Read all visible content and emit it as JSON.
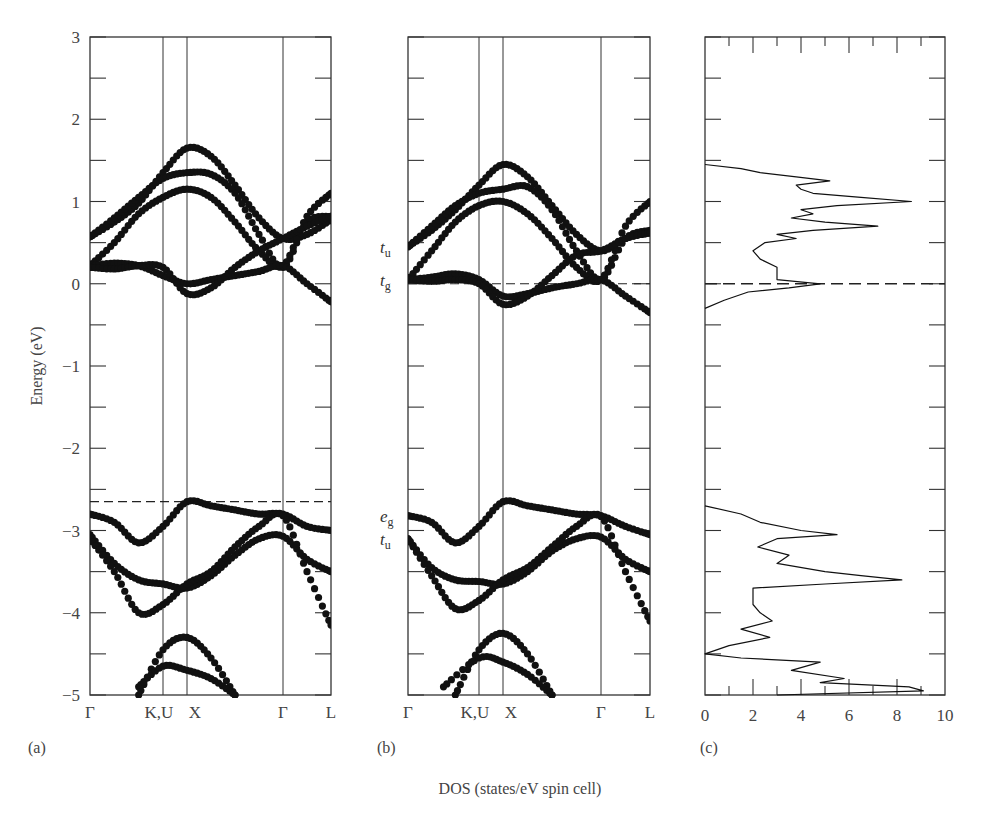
{
  "figure": {
    "y_axis_label": "Energy (eV)",
    "x_axis_label_c": "DOS (states/eV spin cell)",
    "panels": [
      {
        "id": "a",
        "label": "(a)"
      },
      {
        "id": "b",
        "label": "(b)"
      },
      {
        "id": "c",
        "label": "(c)"
      }
    ],
    "y_ticks": [
      "3",
      "2",
      "1",
      "0",
      "−1",
      "−2",
      "−3",
      "−4",
      "−5"
    ],
    "k_points": [
      "Γ",
      "K,U",
      "X",
      "Γ",
      "L"
    ],
    "dos_ticks": [
      "0",
      "2",
      "4",
      "6",
      "8",
      "10"
    ],
    "band_labels_b": [
      {
        "text": "t",
        "sub": "u",
        "energy": 0.45
      },
      {
        "text": "t",
        "sub": "g",
        "energy": 0.05
      },
      {
        "text": "e",
        "sub": "g",
        "energy": -2.82
      },
      {
        "text": "t",
        "sub": "u",
        "energy": -3.1
      }
    ],
    "colors": {
      "ink": "#111111",
      "axis": "#333333",
      "background": "#ffffff"
    }
  },
  "chart_data": [
    {
      "type": "scatter",
      "title": "(a) Band structure",
      "xlabel": "",
      "ylabel": "Energy (eV)",
      "ylim": [
        -5,
        3
      ],
      "x_ticks": [
        "Γ",
        "K,U",
        "X",
        "Γ",
        "L"
      ],
      "x_positions": [
        0,
        0.3,
        0.4,
        0.8,
        1.0
      ],
      "dashed_line_energy": -2.65,
      "grid": false,
      "series": [
        {
          "name": "band 1 (conduction)",
          "x": [
            0,
            0.1,
            0.2,
            0.3,
            0.4,
            0.5,
            0.6,
            0.7,
            0.8,
            0.9,
            1.0
          ],
          "y": [
            0.57,
            0.75,
            0.98,
            1.35,
            1.65,
            1.55,
            1.2,
            0.8,
            0.55,
            0.6,
            0.78
          ]
        },
        {
          "name": "band 2",
          "x": [
            0,
            0.1,
            0.2,
            0.3,
            0.4,
            0.5,
            0.6,
            0.7,
            0.8,
            0.9,
            1.0
          ],
          "y": [
            0.57,
            0.8,
            1.05,
            1.28,
            1.35,
            1.33,
            1.1,
            0.6,
            0.2,
            0.75,
            0.82
          ]
        },
        {
          "name": "band 3",
          "x": [
            0,
            0.1,
            0.2,
            0.3,
            0.4,
            0.5,
            0.6,
            0.7,
            0.8,
            0.9,
            1.0
          ],
          "y": [
            0.22,
            0.5,
            0.85,
            1.05,
            1.15,
            1.05,
            0.75,
            0.4,
            0.22,
            0.82,
            1.1
          ]
        },
        {
          "name": "band 4",
          "x": [
            0,
            0.1,
            0.2,
            0.3,
            0.4,
            0.5,
            0.6,
            0.7,
            0.8,
            0.9,
            1.0
          ],
          "y": [
            0.22,
            0.25,
            0.22,
            0.1,
            0.0,
            0.05,
            0.1,
            0.15,
            0.22,
            0.0,
            -0.22
          ]
        },
        {
          "name": "band 5",
          "x": [
            0,
            0.1,
            0.2,
            0.3,
            0.4,
            0.5,
            0.6,
            0.7,
            0.8,
            0.9,
            1.0
          ],
          "y": [
            0.2,
            0.18,
            0.22,
            0.2,
            -0.12,
            -0.05,
            0.2,
            0.4,
            0.55,
            0.7,
            0.82
          ]
        },
        {
          "name": "valence 1",
          "x": [
            0,
            0.1,
            0.2,
            0.3,
            0.4,
            0.5,
            0.6,
            0.7,
            0.8,
            0.9,
            1.0
          ],
          "y": [
            -2.8,
            -2.9,
            -3.15,
            -2.95,
            -2.65,
            -2.7,
            -2.75,
            -2.8,
            -2.8,
            -2.95,
            -3.0
          ]
        },
        {
          "name": "valence 2",
          "x": [
            0,
            0.1,
            0.2,
            0.3,
            0.4,
            0.5,
            0.6,
            0.7,
            0.8,
            0.9,
            1.0
          ],
          "y": [
            -3.05,
            -3.4,
            -3.6,
            -3.65,
            -3.7,
            -3.55,
            -3.3,
            -3.1,
            -3.07,
            -3.35,
            -3.5
          ]
        },
        {
          "name": "valence 3",
          "x": [
            0,
            0.1,
            0.2,
            0.3,
            0.4,
            0.5,
            0.6,
            0.7,
            0.8,
            0.9,
            1.0
          ],
          "y": [
            -3.1,
            -3.5,
            -4.0,
            -3.9,
            -3.65,
            -3.5,
            -3.2,
            -2.95,
            -2.82,
            -3.5,
            -4.15
          ]
        },
        {
          "name": "valence 4",
          "x": [
            0.2,
            0.3,
            0.4,
            0.5,
            0.6
          ],
          "y": [
            -5.0,
            -4.45,
            -4.3,
            -4.55,
            -5.0
          ]
        },
        {
          "name": "valence 5",
          "x": [
            0.2,
            0.3,
            0.4,
            0.5,
            0.6
          ],
          "y": [
            -4.9,
            -4.65,
            -4.7,
            -4.8,
            -5.0
          ]
        }
      ]
    },
    {
      "type": "scatter",
      "title": "(b) Band structure",
      "xlabel": "",
      "ylabel": "",
      "ylim": [
        -5,
        3
      ],
      "x_ticks": [
        "Γ",
        "K,U",
        "X",
        "Γ",
        "L"
      ],
      "x_positions": [
        0,
        0.3,
        0.4,
        0.8,
        1.0
      ],
      "dashed_line_energy": 0.0,
      "annotations": [
        "t_u (0.45 eV)",
        "t_g (0.05 eV)",
        "e_g (-2.82 eV)",
        "t_u (-3.1 eV)"
      ],
      "grid": false,
      "series": [
        {
          "name": "band 1 (conduction)",
          "x": [
            0,
            0.1,
            0.2,
            0.3,
            0.4,
            0.5,
            0.6,
            0.7,
            0.8,
            0.9,
            1.0
          ],
          "y": [
            0.45,
            0.65,
            0.9,
            1.2,
            1.45,
            1.3,
            0.95,
            0.6,
            0.4,
            0.55,
            0.62
          ]
        },
        {
          "name": "band 2",
          "x": [
            0,
            0.1,
            0.2,
            0.3,
            0.4,
            0.5,
            0.6,
            0.7,
            0.8,
            0.9,
            1.0
          ],
          "y": [
            0.45,
            0.7,
            0.95,
            1.1,
            1.15,
            1.18,
            0.9,
            0.4,
            0.05,
            0.55,
            0.65
          ]
        },
        {
          "name": "band 3",
          "x": [
            0,
            0.1,
            0.2,
            0.3,
            0.4,
            0.5,
            0.6,
            0.7,
            0.8,
            0.9,
            1.0
          ],
          "y": [
            0.05,
            0.4,
            0.75,
            0.95,
            1.0,
            0.85,
            0.55,
            0.2,
            0.05,
            0.7,
            1.0
          ]
        },
        {
          "name": "band 4",
          "x": [
            0,
            0.1,
            0.2,
            0.3,
            0.4,
            0.5,
            0.6,
            0.7,
            0.8,
            0.9,
            1.0
          ],
          "y": [
            0.05,
            0.08,
            0.12,
            0.05,
            -0.15,
            -0.12,
            -0.05,
            0.0,
            0.05,
            -0.15,
            -0.35
          ]
        },
        {
          "name": "band 5",
          "x": [
            0,
            0.1,
            0.2,
            0.3,
            0.4,
            0.5,
            0.6,
            0.7,
            0.8,
            0.9,
            1.0
          ],
          "y": [
            0.05,
            0.03,
            0.05,
            0.0,
            -0.25,
            -0.15,
            0.1,
            0.35,
            0.4,
            0.55,
            0.62
          ]
        },
        {
          "name": "valence 1",
          "x": [
            0,
            0.1,
            0.2,
            0.3,
            0.4,
            0.5,
            0.6,
            0.7,
            0.8,
            0.9,
            1.0
          ],
          "y": [
            -2.82,
            -2.9,
            -3.15,
            -2.95,
            -2.65,
            -2.7,
            -2.75,
            -2.8,
            -2.82,
            -2.95,
            -3.05
          ]
        },
        {
          "name": "valence 2",
          "x": [
            0,
            0.1,
            0.2,
            0.3,
            0.4,
            0.5,
            0.6,
            0.7,
            0.8,
            0.9,
            1.0
          ],
          "y": [
            -3.1,
            -3.45,
            -3.6,
            -3.62,
            -3.65,
            -3.5,
            -3.25,
            -3.1,
            -3.08,
            -3.35,
            -3.5
          ]
        },
        {
          "name": "valence 3",
          "x": [
            0,
            0.1,
            0.2,
            0.3,
            0.4,
            0.5,
            0.6,
            0.7,
            0.8,
            0.9,
            1.0
          ],
          "y": [
            -3.1,
            -3.55,
            -3.95,
            -3.85,
            -3.6,
            -3.45,
            -3.2,
            -2.95,
            -2.83,
            -3.5,
            -4.1
          ]
        },
        {
          "name": "valence 4",
          "x": [
            0.2,
            0.3,
            0.4,
            0.5,
            0.6
          ],
          "y": [
            -5.0,
            -4.45,
            -4.25,
            -4.5,
            -5.0
          ]
        },
        {
          "name": "valence 5",
          "x": [
            0.15,
            0.3,
            0.4,
            0.5,
            0.6
          ],
          "y": [
            -4.9,
            -4.55,
            -4.6,
            -4.75,
            -5.0
          ]
        }
      ]
    },
    {
      "type": "line",
      "title": "(c) Density of states",
      "xlabel": "DOS (states/eV spin cell)",
      "ylabel": "",
      "xlim": [
        0,
        10
      ],
      "ylim": [
        -5,
        3
      ],
      "x_ticks": [
        "0",
        "2",
        "4",
        "6",
        "8",
        "10"
      ],
      "dashed_line_energy": 0.0,
      "grid": false,
      "series": [
        {
          "name": "DOS conduction",
          "energy": [
            -0.3,
            -0.2,
            -0.1,
            -0.05,
            0.0,
            0.05,
            0.1,
            0.2,
            0.3,
            0.4,
            0.5,
            0.55,
            0.6,
            0.65,
            0.7,
            0.75,
            0.8,
            0.85,
            0.9,
            0.95,
            1.0,
            1.05,
            1.1,
            1.15,
            1.2,
            1.25,
            1.3,
            1.35,
            1.4,
            1.45
          ],
          "dos": [
            0.0,
            0.8,
            1.8,
            3.5,
            4.8,
            3.0,
            3.0,
            3.0,
            2.3,
            2.0,
            2.5,
            3.8,
            3.0,
            4.5,
            7.2,
            5.0,
            3.6,
            4.5,
            4.0,
            5.5,
            8.6,
            6.5,
            4.5,
            4.0,
            3.8,
            5.2,
            3.8,
            2.3,
            1.5,
            0.0
          ]
        },
        {
          "name": "DOS valence",
          "energy": [
            -2.7,
            -2.8,
            -2.9,
            -3.0,
            -3.05,
            -3.1,
            -3.2,
            -3.3,
            -3.4,
            -3.5,
            -3.55,
            -3.6,
            -3.65,
            -3.7,
            -3.8,
            -3.9,
            -4.0,
            -4.1,
            -4.2,
            -4.3,
            -4.4,
            -4.5,
            -4.55,
            -4.6,
            -4.7,
            -4.8,
            -4.85,
            -4.9,
            -4.95,
            -5.0
          ],
          "dos": [
            0.0,
            1.5,
            2.3,
            4.0,
            5.5,
            3.0,
            2.2,
            3.5,
            3.0,
            5.0,
            6.5,
            8.2,
            5.0,
            2.0,
            2.0,
            2.0,
            2.3,
            2.8,
            1.5,
            2.7,
            1.0,
            0.0,
            1.5,
            4.8,
            3.6,
            5.8,
            4.8,
            8.5,
            9.1,
            3.0
          ]
        }
      ]
    }
  ]
}
